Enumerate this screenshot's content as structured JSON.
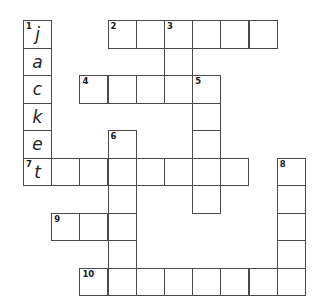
{
  "puzzle": {
    "type": "crossword",
    "grid_origin": {
      "x": 23,
      "y": 20
    },
    "cell_size": {
      "w": 28.2,
      "h": 27.5
    },
    "colors": {
      "border": "#4a4a4a",
      "background": "#ffffff",
      "text": "#222222"
    }
  },
  "clues": [
    {
      "number": "1",
      "direction": "down",
      "row": 0,
      "col": 0,
      "length": 6,
      "answer_shown": "jacket"
    },
    {
      "number": "2",
      "direction": "across",
      "row": 0,
      "col": 3,
      "length": 6
    },
    {
      "number": "3",
      "direction": "down",
      "row": 0,
      "col": 5,
      "length": 3
    },
    {
      "number": "4",
      "direction": "across",
      "row": 2,
      "col": 2,
      "length": 5
    },
    {
      "number": "5",
      "direction": "down",
      "row": 2,
      "col": 6,
      "length": 5
    },
    {
      "number": "6",
      "direction": "down",
      "row": 4,
      "col": 3,
      "length": 6
    },
    {
      "number": "7",
      "direction": "across",
      "row": 5,
      "col": 0,
      "length": 8
    },
    {
      "number": "8",
      "direction": "down",
      "row": 5,
      "col": 9,
      "length": 5
    },
    {
      "number": "9",
      "direction": "across",
      "row": 7,
      "col": 1,
      "length": 3
    },
    {
      "number": "10",
      "direction": "across",
      "row": 9,
      "col": 2,
      "length": 8
    }
  ],
  "cells": [
    {
      "r": 0,
      "c": 0,
      "num": "1",
      "letter": "j"
    },
    {
      "r": 1,
      "c": 0,
      "num": "",
      "letter": "a"
    },
    {
      "r": 2,
      "c": 0,
      "num": "",
      "letter": "c"
    },
    {
      "r": 3,
      "c": 0,
      "num": "",
      "letter": "k"
    },
    {
      "r": 4,
      "c": 0,
      "num": "",
      "letter": "e"
    },
    {
      "r": 5,
      "c": 0,
      "num": "7",
      "letter": "t"
    },
    {
      "r": 0,
      "c": 3,
      "num": "2",
      "letter": ""
    },
    {
      "r": 0,
      "c": 4,
      "num": "",
      "letter": ""
    },
    {
      "r": 0,
      "c": 5,
      "num": "3",
      "letter": ""
    },
    {
      "r": 0,
      "c": 6,
      "num": "",
      "letter": ""
    },
    {
      "r": 0,
      "c": 7,
      "num": "",
      "letter": ""
    },
    {
      "r": 0,
      "c": 8,
      "num": "",
      "letter": ""
    },
    {
      "r": 1,
      "c": 5,
      "num": "",
      "letter": ""
    },
    {
      "r": 2,
      "c": 2,
      "num": "4",
      "letter": ""
    },
    {
      "r": 2,
      "c": 3,
      "num": "",
      "letter": ""
    },
    {
      "r": 2,
      "c": 4,
      "num": "",
      "letter": ""
    },
    {
      "r": 2,
      "c": 5,
      "num": "",
      "letter": ""
    },
    {
      "r": 2,
      "c": 6,
      "num": "5",
      "letter": ""
    },
    {
      "r": 3,
      "c": 6,
      "num": "",
      "letter": ""
    },
    {
      "r": 4,
      "c": 6,
      "num": "",
      "letter": ""
    },
    {
      "r": 6,
      "c": 6,
      "num": "",
      "letter": ""
    },
    {
      "r": 4,
      "c": 3,
      "num": "6",
      "letter": ""
    },
    {
      "r": 5,
      "c": 1,
      "num": "",
      "letter": ""
    },
    {
      "r": 5,
      "c": 2,
      "num": "",
      "letter": ""
    },
    {
      "r": 5,
      "c": 3,
      "num": "",
      "letter": ""
    },
    {
      "r": 5,
      "c": 4,
      "num": "",
      "letter": ""
    },
    {
      "r": 5,
      "c": 5,
      "num": "",
      "letter": ""
    },
    {
      "r": 5,
      "c": 6,
      "num": "",
      "letter": ""
    },
    {
      "r": 5,
      "c": 7,
      "num": "",
      "letter": ""
    },
    {
      "r": 6,
      "c": 3,
      "num": "",
      "letter": ""
    },
    {
      "r": 7,
      "c": 1,
      "num": "9",
      "letter": ""
    },
    {
      "r": 7,
      "c": 2,
      "num": "",
      "letter": ""
    },
    {
      "r": 7,
      "c": 3,
      "num": "",
      "letter": ""
    },
    {
      "r": 8,
      "c": 3,
      "num": "",
      "letter": ""
    },
    {
      "r": 5,
      "c": 9,
      "num": "8",
      "letter": ""
    },
    {
      "r": 6,
      "c": 9,
      "num": "",
      "letter": ""
    },
    {
      "r": 7,
      "c": 9,
      "num": "",
      "letter": ""
    },
    {
      "r": 8,
      "c": 9,
      "num": "",
      "letter": ""
    },
    {
      "r": 9,
      "c": 2,
      "num": "10",
      "letter": ""
    },
    {
      "r": 9,
      "c": 3,
      "num": "",
      "letter": ""
    },
    {
      "r": 9,
      "c": 4,
      "num": "",
      "letter": ""
    },
    {
      "r": 9,
      "c": 5,
      "num": "",
      "letter": ""
    },
    {
      "r": 9,
      "c": 6,
      "num": "",
      "letter": ""
    },
    {
      "r": 9,
      "c": 7,
      "num": "",
      "letter": ""
    },
    {
      "r": 9,
      "c": 8,
      "num": "",
      "letter": ""
    },
    {
      "r": 9,
      "c": 9,
      "num": "",
      "letter": ""
    }
  ]
}
